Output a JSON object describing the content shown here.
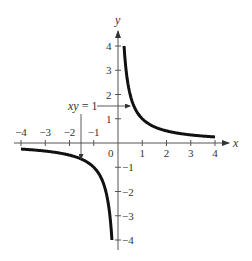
{
  "chart_data": {
    "type": "line",
    "title": "",
    "function": "y = 1/x",
    "xlabel": "x",
    "ylabel": "y",
    "xlim": [
      -4,
      4
    ],
    "ylim": [
      -4,
      4
    ],
    "grid": false,
    "legend": null,
    "x_ticks": [
      -4,
      -3,
      -2,
      -1,
      1,
      2,
      3,
      4
    ],
    "x_tick_labels": [
      "−4",
      "−3",
      "−2",
      "−1",
      "1",
      "2",
      "3",
      "4"
    ],
    "y_ticks": [
      4,
      3,
      2,
      1,
      -1,
      -2,
      -3,
      -4
    ],
    "y_tick_labels": [
      "4",
      "3",
      "2",
      "1",
      "−1",
      "−2",
      "−3",
      "−4"
    ],
    "origin_label": "0",
    "series": [
      {
        "name": "branch-positive",
        "x": [
          0.25,
          0.3,
          0.4,
          0.5,
          0.75,
          1,
          1.5,
          2,
          2.5,
          3,
          3.5,
          4
        ],
        "y": [
          4,
          3.33,
          2.5,
          2,
          1.33,
          1,
          0.67,
          0.5,
          0.4,
          0.33,
          0.29,
          0.25
        ]
      },
      {
        "name": "branch-negative",
        "x": [
          -4,
          -3.5,
          -3,
          -2.5,
          -2,
          -1.5,
          -1,
          -0.75,
          -0.5,
          -0.4,
          -0.3,
          -0.25
        ],
        "y": [
          -0.25,
          -0.29,
          -0.33,
          -0.4,
          -0.5,
          -0.67,
          -1,
          -1.33,
          -2,
          -2.5,
          -3.33,
          -4
        ]
      }
    ],
    "annotations": [
      {
        "text": "xy = 1",
        "arrows_to": [
          [
            0.5,
            2
          ],
          [
            -1.5,
            -0.67
          ]
        ]
      }
    ]
  },
  "labels": {
    "x_axis": "x",
    "y_axis": "y",
    "origin": "0",
    "annotation_prefix": "xy",
    "annotation_suffix": " = 1"
  }
}
